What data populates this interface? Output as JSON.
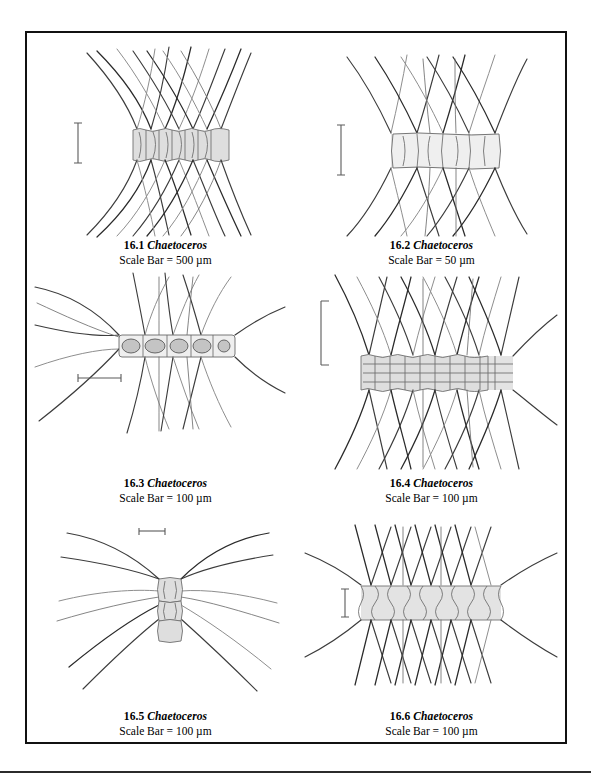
{
  "plate": {
    "border_color": "#111111",
    "background": "#ffffff",
    "cell_fill": "#dedede",
    "seta_color": "#3c3c3c"
  },
  "figures": [
    {
      "id": "16.1",
      "number_label": "16.1",
      "genus": "Chaetoceros",
      "scale_label": "Scale Bar = 500 µm",
      "scale_value": "500",
      "scale_unit": "µm",
      "scale_bar_orientation": "vertical",
      "cell_count": 7,
      "morphology": "broad chain, stippled rectangular cells, long crossing arched setae"
    },
    {
      "id": "16.2",
      "number_label": "16.2",
      "genus": "Chaetoceros",
      "scale_label": "Scale Bar = 50 µm",
      "scale_value": "50",
      "scale_unit": "µm",
      "scale_bar_orientation": "vertical",
      "cell_count": 5,
      "morphology": "chain of five rounded-rectangular cells with sweeping paired setae"
    },
    {
      "id": "16.3",
      "number_label": "16.3",
      "genus": "Chaetoceros",
      "scale_label": "Scale Bar = 100 µm",
      "scale_value": "100",
      "scale_unit": "µm",
      "scale_bar_orientation": "horizontal",
      "cell_count": 5,
      "morphology": "narrow chain with granular chloroplasts and very long terminal setae"
    },
    {
      "id": "16.4",
      "number_label": "16.4",
      "genus": "Chaetoceros",
      "scale_label": "Scale Bar = 100 µm",
      "scale_value": "100",
      "scale_unit": "µm",
      "scale_bar_orientation": "vertical-bracket",
      "cell_count": 8,
      "morphology": "dense chain of narrow cells with internal rings, dense crossing setae"
    },
    {
      "id": "16.5",
      "number_label": "16.5",
      "genus": "Chaetoceros",
      "scale_label": "Scale Bar = 100 µm",
      "scale_value": "100",
      "scale_unit": "µm",
      "scale_bar_orientation": "horizontal",
      "cell_count": 3,
      "morphology": "short three-cell chain with six very long sweeping setae"
    },
    {
      "id": "16.6",
      "number_label": "16.6",
      "genus": "Chaetoceros",
      "scale_label": "Scale Bar = 100 µm",
      "scale_value": "100",
      "scale_unit": "µm",
      "scale_bar_orientation": "vertical",
      "cell_count": 9,
      "morphology": "banded chain with hourglass cell walls and straight radiating setae"
    }
  ]
}
